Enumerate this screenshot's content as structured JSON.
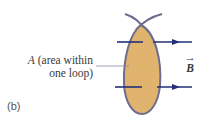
{
  "figure": {
    "panel_label": "(b)",
    "area_label": {
      "symbol": "A",
      "line1_rest": " (area within",
      "line2": "one loop)"
    },
    "field_label": {
      "symbol": "B",
      "vector_arrow": "→"
    }
  },
  "colors": {
    "loop_fill": "#E0B46E",
    "loop_stroke": "#6F6D8E",
    "field_line": "#22307A",
    "leader_line": "#8A86A6",
    "text": "#3a3a3a"
  }
}
